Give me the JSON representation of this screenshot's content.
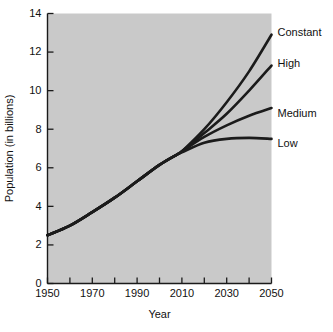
{
  "chart_data": {
    "type": "line",
    "title": "",
    "xlabel": "Year",
    "ylabel": "Population (in billions)",
    "xlim": [
      1950,
      2050
    ],
    "ylim": [
      0,
      14
    ],
    "grid": false,
    "legend_position": "right-inline-labels",
    "background_color": "#c9c9c9",
    "line_color": "#1b1b1b",
    "x_tick_labels": [
      "1950",
      "1970",
      "1990",
      "2010",
      "2030",
      "2050"
    ],
    "x_tick_values": [
      1950,
      1970,
      1990,
      2010,
      2030,
      2050
    ],
    "x_minor_tick_values": [
      1960,
      1980,
      2000,
      2020,
      2040
    ],
    "y_tick_labels": [
      "0",
      "2",
      "4",
      "6",
      "8",
      "10",
      "12",
      "14"
    ],
    "y_tick_values": [
      0,
      2,
      4,
      6,
      8,
      10,
      12,
      14
    ],
    "x": [
      1950,
      1960,
      1970,
      1980,
      1990,
      2000,
      2008,
      2010,
      2020,
      2030,
      2040,
      2050
    ],
    "series": [
      {
        "name": "Constant",
        "label": "Constant",
        "values": [
          2.5,
          3.0,
          3.7,
          4.45,
          5.3,
          6.15,
          6.7,
          6.85,
          8.0,
          9.4,
          11.0,
          12.9
        ],
        "end_value": 12.9
      },
      {
        "name": "High",
        "label": "High",
        "values": [
          2.5,
          3.0,
          3.7,
          4.45,
          5.3,
          6.15,
          6.7,
          6.85,
          7.8,
          8.8,
          10.0,
          11.3
        ],
        "end_value": 11.3
      },
      {
        "name": "Medium",
        "label": "Medium",
        "values": [
          2.5,
          3.0,
          3.7,
          4.45,
          5.3,
          6.15,
          6.7,
          6.85,
          7.6,
          8.2,
          8.7,
          9.1
        ],
        "end_value": 9.1
      },
      {
        "name": "Low",
        "label": "Low",
        "values": [
          2.5,
          3.0,
          3.7,
          4.45,
          5.3,
          6.15,
          6.7,
          6.8,
          7.3,
          7.5,
          7.55,
          7.5
        ],
        "end_value": 7.5
      }
    ]
  }
}
